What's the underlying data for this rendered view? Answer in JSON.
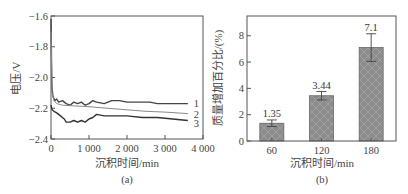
{
  "chart_data": [
    {
      "type": "line",
      "panel_label": "(a)",
      "title": "",
      "xlabel": "沉积时间/min",
      "ylabel": "电压/V",
      "xlim": [
        0,
        4000
      ],
      "ylim": [
        -2.4,
        -1.6
      ],
      "x_ticks": [
        0,
        1000,
        2000,
        3000,
        4000
      ],
      "x_tick_labels": [
        "0",
        "1 000",
        "2 000",
        "3 000",
        "4 000"
      ],
      "y_ticks": [
        -2.4,
        -2.2,
        -2.0,
        -1.8,
        -1.6
      ],
      "y_tick_labels": [
        "−2.4",
        "−2.2",
        "−2.0",
        "−1.8",
        "−1.6"
      ],
      "grid": false,
      "series": [
        {
          "name": "1",
          "color": "#444444",
          "x": [
            0,
            20,
            50,
            100,
            150,
            200,
            300,
            400,
            500,
            600,
            700,
            800,
            900,
            1000,
            1100,
            1200,
            1400,
            1600,
            1800,
            2000,
            2200,
            2400,
            2600,
            2800,
            3000,
            3200,
            3400,
            3600
          ],
          "y": [
            -1.62,
            -2.05,
            -2.12,
            -2.15,
            -2.14,
            -2.16,
            -2.15,
            -2.17,
            -2.18,
            -2.16,
            -2.17,
            -2.16,
            -2.18,
            -2.17,
            -2.15,
            -2.16,
            -2.17,
            -2.15,
            -2.15,
            -2.16,
            -2.16,
            -2.16,
            -2.16,
            -2.17,
            -2.17,
            -2.17,
            -2.17,
            -2.17
          ]
        },
        {
          "name": "2",
          "color": "#888888",
          "x": [
            0,
            30,
            80,
            150,
            300,
            600,
            1000,
            1500,
            2000,
            2500,
            3000,
            3600
          ],
          "y": [
            -1.7,
            -2.1,
            -2.15,
            -2.17,
            -2.18,
            -2.185,
            -2.19,
            -2.2,
            -2.21,
            -2.22,
            -2.225,
            -2.235
          ]
        },
        {
          "name": "3",
          "color": "#333333",
          "x": [
            0,
            30,
            80,
            150,
            250,
            350,
            400,
            500,
            600,
            700,
            800,
            900,
            1000,
            1100,
            1200,
            1400,
            1600,
            1800,
            2000,
            2400,
            2800,
            3200,
            3600
          ],
          "y": [
            -2.18,
            -2.21,
            -2.22,
            -2.23,
            -2.25,
            -2.27,
            -2.29,
            -2.29,
            -2.28,
            -2.29,
            -2.28,
            -2.29,
            -2.27,
            -2.26,
            -2.24,
            -2.25,
            -2.25,
            -2.25,
            -2.25,
            -2.26,
            -2.26,
            -2.27,
            -2.28
          ]
        }
      ],
      "legend": {
        "entries": [
          "1",
          "2",
          "3"
        ],
        "position": "right-inline"
      }
    },
    {
      "type": "bar",
      "panel_label": "(b)",
      "title": "",
      "xlabel": "沉积时间/min",
      "ylabel": "质量增加百分比/(%)",
      "categories": [
        "60",
        "120",
        "180"
      ],
      "values": [
        1.35,
        3.44,
        7.1
      ],
      "value_labels": [
        "1.35",
        "3.44",
        "7.1"
      ],
      "error": [
        0.25,
        0.32,
        1.05
      ],
      "ylim": [
        0,
        9.5
      ],
      "y_ticks": [
        0,
        2,
        4,
        6,
        8
      ],
      "y_tick_labels": [
        "0",
        "2",
        "4",
        "6",
        "8"
      ],
      "bar_color": "#8a8a8a",
      "pattern": "crosshatch",
      "grid": false
    }
  ]
}
